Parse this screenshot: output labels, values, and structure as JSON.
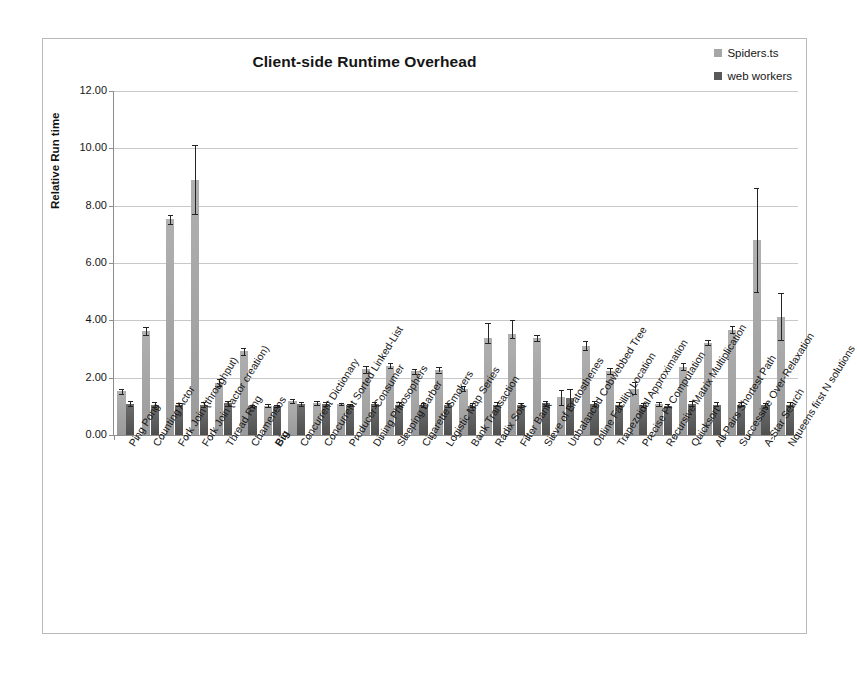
{
  "chart_data": {
    "type": "bar",
    "title": "Client-side Runtime Overhead",
    "xlabel": "",
    "ylabel": "Relative Run time",
    "ylim": [
      0,
      12
    ],
    "ytick_step": 2,
    "ytick_labels": [
      "0.00",
      "2.00",
      "4.00",
      "6.00",
      "8.00",
      "10.00",
      "12.00"
    ],
    "grid": true,
    "legend_position": "top-right",
    "error_bars": true,
    "colors": {
      "series0": "#a6a6a6",
      "series1": "#595959",
      "gridline": "#c8c8c8",
      "axis": "#8d8d8d",
      "border": "#b9b9b9"
    },
    "categories": [
      "Ping Pong",
      "Counting Actor",
      "Fork Join (throughput)",
      "Fork Join (actor creation)",
      "Thread Ring",
      "Chameneos",
      "Big",
      "Concurrent Dictionary",
      "Concurrent Sorted Linked-List",
      "Producer-Consumer",
      "Dining Philosophers",
      "Sleeping Barber",
      "Cigarette Smokers",
      "Logistic Map Series",
      "Bank Transaction",
      "Radix Sort",
      "Filter Bank",
      "Sieve of Eratosthenes",
      "Unbalanced Cobwebbed Tree",
      "Online Facility Location",
      "Trapezoidal Approximation",
      "Precise Pi Computation",
      "Recursive Matrix Multiplication",
      "Quicksort",
      "All-Pairs Shortest Path",
      "Successive Over-Relaxation",
      "A-Star Search",
      "Nqueens first N solutions"
    ],
    "bold_categories": [
      "Big"
    ],
    "series": [
      {
        "name": "Spiders.ts",
        "color": "#a6a6a6",
        "values": [
          1.52,
          3.62,
          7.52,
          8.9,
          1.82,
          2.92,
          1.02,
          1.18,
          1.12,
          1.08,
          2.3,
          2.42,
          2.22,
          2.28,
          1.62,
          3.38,
          3.52,
          3.38,
          1.32,
          3.12,
          2.22,
          1.62,
          1.08,
          2.38,
          3.22,
          3.68,
          6.8,
          4.1
        ],
        "err_low": [
          1.44,
          3.48,
          7.36,
          7.7,
          1.7,
          2.8,
          0.98,
          1.12,
          1.06,
          1.04,
          2.18,
          2.34,
          2.14,
          2.18,
          1.54,
          3.22,
          3.4,
          3.28,
          1.06,
          2.96,
          2.12,
          1.42,
          1.0,
          2.26,
          3.14,
          3.56,
          5.0,
          3.3
        ],
        "err_high": [
          1.6,
          3.78,
          7.68,
          10.1,
          1.94,
          3.04,
          1.08,
          1.24,
          1.18,
          1.12,
          2.42,
          2.5,
          2.3,
          2.38,
          1.7,
          3.9,
          4.02,
          3.48,
          1.58,
          3.28,
          2.32,
          1.84,
          1.16,
          2.5,
          3.3,
          3.8,
          8.6,
          4.96
        ]
      },
      {
        "name": "web workers",
        "color": "#595959",
        "values": [
          1.08,
          1.06,
          1.06,
          1.04,
          1.1,
          1.0,
          1.02,
          1.08,
          1.08,
          1.04,
          1.08,
          1.06,
          1.04,
          1.04,
          1.02,
          1.06,
          1.04,
          1.1,
          1.3,
          1.08,
          1.06,
          1.04,
          1.02,
          1.08,
          1.06,
          1.06,
          1.04,
          1.06
        ],
        "err_low": [
          1.0,
          0.96,
          1.0,
          0.96,
          1.02,
          0.96,
          0.98,
          1.02,
          1.02,
          1.0,
          1.02,
          1.0,
          0.98,
          0.98,
          0.96,
          1.0,
          0.98,
          1.02,
          1.02,
          1.0,
          1.0,
          0.98,
          0.96,
          1.0,
          1.0,
          1.0,
          0.98,
          1.0
        ],
        "err_high": [
          1.18,
          1.16,
          1.12,
          1.14,
          1.2,
          1.04,
          1.06,
          1.16,
          1.14,
          1.08,
          1.16,
          1.14,
          1.12,
          1.12,
          1.1,
          1.14,
          1.12,
          1.2,
          1.62,
          1.18,
          1.14,
          1.12,
          1.08,
          1.18,
          1.14,
          1.14,
          1.12,
          1.14
        ]
      }
    ]
  },
  "legend": {
    "items": [
      {
        "label": "Spiders.ts",
        "color": "#a6a6a6"
      },
      {
        "label": "web workers",
        "color": "#595959"
      }
    ]
  }
}
